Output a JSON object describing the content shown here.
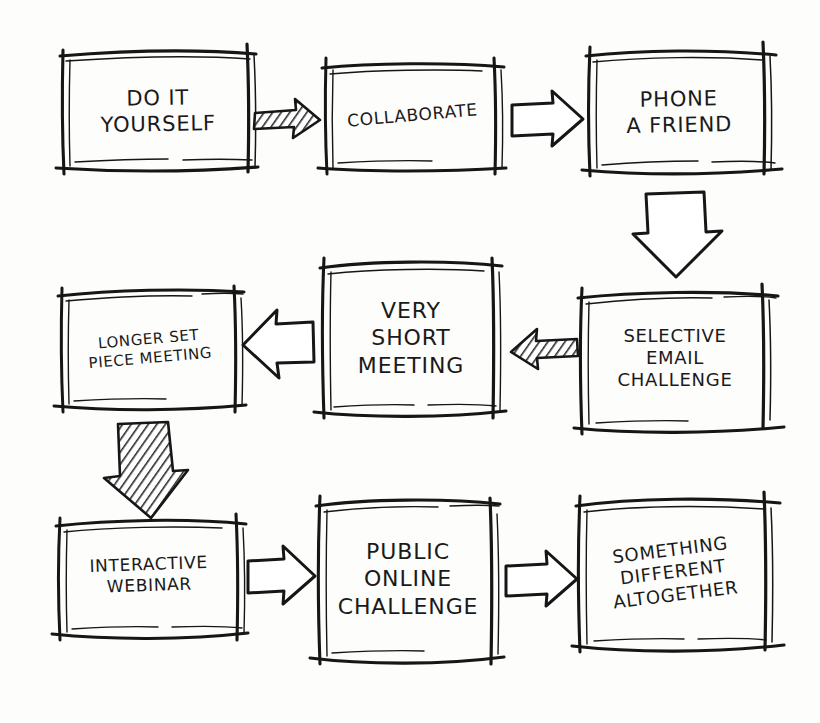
{
  "diagram": {
    "style": "hand-drawn sketch",
    "background_color": "#fdfdfc",
    "ink_color": "#1a1a1a",
    "nodes": [
      {
        "id": "do-it-yourself",
        "label": "DO IT YOURSELF",
        "lines": [
          "DO IT",
          "YOURSELF"
        ],
        "row": 1,
        "column": 1,
        "font_size": 21,
        "rotation": -1,
        "box": {
          "x": 62,
          "y": 52,
          "w": 192,
          "h": 118
        }
      },
      {
        "id": "collaborate",
        "label": "COLLABORATE",
        "lines": [
          "COLLABORATE"
        ],
        "row": 1,
        "column": 2,
        "font_size": 17,
        "rotation": -5,
        "box": {
          "x": 325,
          "y": 63,
          "w": 175,
          "h": 105
        }
      },
      {
        "id": "phone-a-friend",
        "label": "PHONE A FRIEND",
        "lines": [
          "PHONE",
          "A FRIEND"
        ],
        "row": 1,
        "column": 3,
        "font_size": 21,
        "rotation": -1,
        "box": {
          "x": 588,
          "y": 52,
          "w": 182,
          "h": 120
        }
      },
      {
        "id": "longer-set-piece-meeting",
        "label": "LONGER SET PIECE MEETING",
        "lines": [
          "LONGER SET",
          "PIECE MEETING"
        ],
        "row": 2,
        "column": 1,
        "font_size": 15,
        "rotation": -5,
        "box": {
          "x": 62,
          "y": 290,
          "w": 175,
          "h": 118
        }
      },
      {
        "id": "very-short-meeting",
        "label": "VERY SHORT MEETING",
        "lines": [
          "VERY",
          "SHORT",
          "MEETING"
        ],
        "row": 2,
        "column": 2,
        "font_size": 22,
        "rotation": 0,
        "box": {
          "x": 322,
          "y": 262,
          "w": 178,
          "h": 152
        }
      },
      {
        "id": "selective-email-challenge",
        "label": "SELECTIVE EMAIL CHALLENGE",
        "lines": [
          "SELECTIVE",
          "EMAIL",
          "CHALLENGE"
        ],
        "row": 2,
        "column": 3,
        "font_size": 18,
        "rotation": 0,
        "box": {
          "x": 582,
          "y": 292,
          "w": 186,
          "h": 132
        }
      },
      {
        "id": "interactive-webinar",
        "label": "INTERACTIVE WEBINAR",
        "lines": [
          "INTERACTIVE",
          "WEBINAR"
        ],
        "row": 3,
        "column": 1,
        "font_size": 17,
        "rotation": -2,
        "box": {
          "x": 58,
          "y": 520,
          "w": 182,
          "h": 110
        }
      },
      {
        "id": "public-online-challenge",
        "label": "PUBLIC ONLINE CHALLENGE",
        "lines": [
          "PUBLIC",
          "ONLINE",
          "CHALLENGE"
        ],
        "row": 3,
        "column": 2,
        "font_size": 22,
        "rotation": 0,
        "box": {
          "x": 318,
          "y": 500,
          "w": 180,
          "h": 158
        }
      },
      {
        "id": "something-different-altogether",
        "label": "SOMETHING DIFFERENT ALTOGETHER",
        "lines": [
          "SOMETHING",
          "DIFFERENT",
          "ALTOGETHER"
        ],
        "row": 3,
        "column": 3,
        "font_size": 18,
        "rotation": -7,
        "box": {
          "x": 578,
          "y": 500,
          "w": 190,
          "h": 145
        }
      }
    ],
    "arrows": [
      {
        "id": "arrow-diy-to-collaborate",
        "from": "do-it-yourself",
        "to": "collaborate",
        "direction": "right",
        "fill": "hatched"
      },
      {
        "id": "arrow-collaborate-to-phone",
        "from": "collaborate",
        "to": "phone-a-friend",
        "direction": "right",
        "fill": "outline"
      },
      {
        "id": "arrow-phone-to-email",
        "from": "phone-a-friend",
        "to": "selective-email-challenge",
        "direction": "down",
        "fill": "outline"
      },
      {
        "id": "arrow-email-to-short-meeting",
        "from": "selective-email-challenge",
        "to": "very-short-meeting",
        "direction": "left",
        "fill": "hatched"
      },
      {
        "id": "arrow-short-to-longer-meeting",
        "from": "very-short-meeting",
        "to": "longer-set-piece-meeting",
        "direction": "left",
        "fill": "outline"
      },
      {
        "id": "arrow-longer-meeting-to-webinar",
        "from": "longer-set-piece-meeting",
        "to": "interactive-webinar",
        "direction": "down",
        "fill": "hatched"
      },
      {
        "id": "arrow-webinar-to-public-challenge",
        "from": "interactive-webinar",
        "to": "public-online-challenge",
        "direction": "right",
        "fill": "outline"
      },
      {
        "id": "arrow-public-challenge-to-something-different",
        "from": "public-online-challenge",
        "to": "something-different-altogether",
        "direction": "right",
        "fill": "outline"
      }
    ]
  }
}
